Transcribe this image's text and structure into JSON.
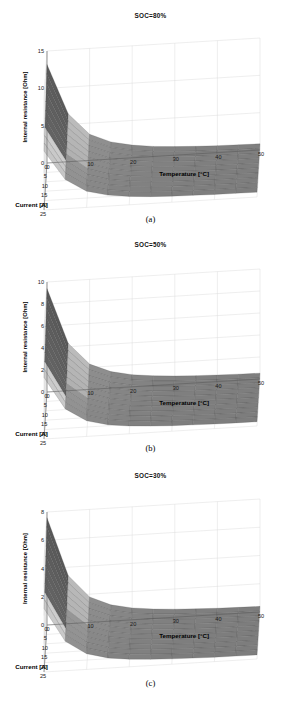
{
  "figure": {
    "background": "#ffffff",
    "grid_color": "#d9d9d9",
    "panels": [
      "a",
      "b",
      "c"
    ]
  },
  "panel_a": {
    "title": "SOC=80%",
    "caption": "(a)",
    "xlabel": "Current [A]",
    "ylabel": "Temperature [°C]",
    "zlabel": "Internal resistance [Ohm]",
    "xticks": [
      "0",
      "5",
      "10",
      "15",
      "20",
      "25"
    ],
    "yticks": [
      "0",
      "10",
      "20",
      "30",
      "40",
      "50"
    ],
    "zticks": [
      "0",
      "5",
      "10",
      "15"
    ]
  },
  "panel_b": {
    "title": "SOC=50%",
    "caption": "(b)",
    "xlabel": "Current [A]",
    "ylabel": "Temperature [°C]",
    "zlabel": "Internal resistance [Ohm]",
    "xticks": [
      "0",
      "5",
      "10",
      "15",
      "20",
      "25"
    ],
    "yticks": [
      "0",
      "10",
      "20",
      "30",
      "40",
      "50"
    ],
    "zticks": [
      "0",
      "2",
      "4",
      "6",
      "8",
      "10"
    ]
  },
  "panel_c": {
    "title": "SOC=30%",
    "caption": "(c)",
    "xlabel": "Current [A]",
    "ylabel": "Temperature [°C]",
    "zlabel": "Internal resistance [Ohm]",
    "xticks": [
      "0",
      "5",
      "10",
      "15",
      "20",
      "25"
    ],
    "yticks": [
      "0",
      "10",
      "20",
      "30",
      "40",
      "50"
    ],
    "zticks": [
      "0",
      "2",
      "4",
      "6",
      "8"
    ]
  },
  "chart_data": [
    {
      "type": "surface",
      "title": "SOC=80%",
      "caption": "(a)",
      "xlabel": "Current [A]",
      "ylabel": "Temperature [°C]",
      "zlabel": "Internal resistance [Ohm]",
      "xlim": [
        0,
        25
      ],
      "ylim": [
        0,
        50
      ],
      "zlim": [
        0,
        15
      ],
      "xticks": [
        0,
        5,
        10,
        15,
        20,
        25
      ],
      "yticks": [
        0,
        10,
        20,
        30,
        40,
        50
      ],
      "zticks": [
        0,
        5,
        10,
        15
      ],
      "grid": true,
      "colormap": "gray",
      "x": [
        0,
        2.5,
        5,
        7.5,
        10,
        12.5,
        15,
        17.5,
        20,
        22.5,
        25
      ],
      "y": [
        0,
        5,
        10,
        15,
        20,
        25,
        30,
        35,
        40,
        45,
        50
      ],
      "z": [
        [
          13.2,
          6.4,
          3.5,
          2.3,
          1.7,
          1.35,
          1.15,
          1.02,
          0.93,
          0.87,
          0.83
        ],
        [
          12.6,
          6.1,
          3.35,
          2.2,
          1.63,
          1.3,
          1.11,
          0.99,
          0.9,
          0.85,
          0.81
        ],
        [
          12.0,
          5.8,
          3.2,
          2.1,
          1.56,
          1.25,
          1.07,
          0.96,
          0.88,
          0.83,
          0.79
        ],
        [
          11.4,
          5.5,
          3.05,
          2.0,
          1.49,
          1.2,
          1.03,
          0.92,
          0.85,
          0.8,
          0.77
        ],
        [
          10.8,
          5.25,
          2.9,
          1.92,
          1.43,
          1.15,
          0.99,
          0.89,
          0.82,
          0.78,
          0.75
        ],
        [
          10.2,
          5.0,
          2.76,
          1.84,
          1.37,
          1.11,
          0.95,
          0.86,
          0.8,
          0.76,
          0.73
        ],
        [
          9.7,
          4.75,
          2.63,
          1.76,
          1.32,
          1.07,
          0.92,
          0.83,
          0.77,
          0.74,
          0.71
        ],
        [
          9.2,
          4.5,
          2.5,
          1.68,
          1.26,
          1.03,
          0.89,
          0.81,
          0.75,
          0.72,
          0.69
        ],
        [
          8.7,
          4.3,
          2.38,
          1.6,
          1.21,
          0.99,
          0.86,
          0.78,
          0.73,
          0.7,
          0.68
        ],
        [
          8.3,
          4.1,
          2.27,
          1.53,
          1.16,
          0.95,
          0.83,
          0.76,
          0.71,
          0.68,
          0.66
        ],
        [
          7.9,
          3.9,
          2.17,
          1.47,
          1.12,
          0.92,
          0.81,
          0.74,
          0.69,
          0.67,
          0.65
        ]
      ]
    },
    {
      "type": "surface",
      "title": "SOC=50%",
      "caption": "(b)",
      "xlabel": "Current [A]",
      "ylabel": "Temperature [°C]",
      "zlabel": "Internal resistance [Ohm]",
      "xlim": [
        0,
        25
      ],
      "ylim": [
        0,
        50
      ],
      "zlim": [
        0,
        10
      ],
      "xticks": [
        0,
        5,
        10,
        15,
        20,
        25
      ],
      "yticks": [
        0,
        10,
        20,
        30,
        40,
        50
      ],
      "zticks": [
        0,
        2,
        4,
        6,
        8,
        10
      ],
      "grid": true,
      "colormap": "gray",
      "x": [
        0,
        2.5,
        5,
        7.5,
        10,
        12.5,
        15,
        17.5,
        20,
        22.5,
        25
      ],
      "y": [
        0,
        5,
        10,
        15,
        20,
        25,
        30,
        35,
        40,
        45,
        50
      ],
      "z": [
        [
          9.4,
          4.3,
          2.3,
          1.5,
          1.1,
          0.88,
          0.75,
          0.66,
          0.6,
          0.56,
          0.53
        ],
        [
          9.0,
          4.1,
          2.2,
          1.43,
          1.05,
          0.84,
          0.72,
          0.64,
          0.58,
          0.54,
          0.52
        ],
        [
          8.5,
          3.9,
          2.1,
          1.37,
          1.0,
          0.8,
          0.69,
          0.61,
          0.56,
          0.52,
          0.5
        ],
        [
          8.1,
          3.7,
          2.0,
          1.3,
          0.96,
          0.77,
          0.66,
          0.59,
          0.54,
          0.51,
          0.48
        ],
        [
          7.7,
          3.55,
          1.9,
          1.24,
          0.92,
          0.74,
          0.63,
          0.57,
          0.52,
          0.49,
          0.47
        ],
        [
          7.3,
          3.37,
          1.81,
          1.19,
          0.88,
          0.71,
          0.61,
          0.55,
          0.5,
          0.47,
          0.45
        ],
        [
          6.9,
          3.2,
          1.72,
          1.13,
          0.84,
          0.68,
          0.59,
          0.53,
          0.48,
          0.46,
          0.44
        ],
        [
          6.6,
          3.04,
          1.64,
          1.08,
          0.8,
          0.65,
          0.56,
          0.51,
          0.47,
          0.44,
          0.42
        ],
        [
          6.2,
          2.89,
          1.56,
          1.03,
          0.77,
          0.63,
          0.54,
          0.49,
          0.45,
          0.43,
          0.41
        ],
        [
          5.9,
          2.75,
          1.49,
          0.99,
          0.74,
          0.6,
          0.52,
          0.47,
          0.44,
          0.42,
          0.4
        ],
        [
          5.6,
          2.62,
          1.42,
          0.94,
          0.71,
          0.58,
          0.5,
          0.46,
          0.42,
          0.4,
          0.39
        ]
      ]
    },
    {
      "type": "surface",
      "title": "SOC=30%",
      "caption": "(c)",
      "xlabel": "Current [A]",
      "ylabel": "Temperature [°C]",
      "zlabel": "Internal resistance [Ohm]",
      "xlim": [
        0,
        25
      ],
      "ylim": [
        0,
        50
      ],
      "zlim": [
        0,
        8
      ],
      "xticks": [
        0,
        5,
        10,
        15,
        20,
        25
      ],
      "yticks": [
        0,
        10,
        20,
        30,
        40,
        50
      ],
      "zticks": [
        0,
        2,
        4,
        6,
        8
      ],
      "grid": true,
      "colormap": "gray",
      "x": [
        0,
        2.5,
        5,
        7.5,
        10,
        12.5,
        15,
        17.5,
        20,
        22.5,
        25
      ],
      "y": [
        0,
        5,
        10,
        15,
        20,
        25,
        30,
        35,
        40,
        45,
        50
      ],
      "z": [
        [
          7.6,
          3.4,
          1.8,
          1.15,
          0.84,
          0.67,
          0.57,
          0.5,
          0.45,
          0.42,
          0.4
        ],
        [
          7.3,
          3.25,
          1.72,
          1.1,
          0.8,
          0.64,
          0.55,
          0.48,
          0.44,
          0.41,
          0.39
        ],
        [
          6.9,
          3.1,
          1.64,
          1.05,
          0.77,
          0.62,
          0.53,
          0.47,
          0.42,
          0.4,
          0.38
        ],
        [
          6.6,
          2.95,
          1.56,
          1.0,
          0.73,
          0.59,
          0.5,
          0.45,
          0.41,
          0.38,
          0.36
        ],
        [
          6.2,
          2.8,
          1.49,
          0.96,
          0.7,
          0.56,
          0.48,
          0.43,
          0.39,
          0.37,
          0.35
        ],
        [
          5.9,
          2.67,
          1.42,
          0.91,
          0.67,
          0.54,
          0.46,
          0.41,
          0.38,
          0.36,
          0.34
        ],
        [
          5.6,
          2.54,
          1.35,
          0.87,
          0.64,
          0.52,
          0.44,
          0.4,
          0.36,
          0.34,
          0.33
        ],
        [
          5.3,
          2.41,
          1.29,
          0.83,
          0.61,
          0.49,
          0.43,
          0.38,
          0.35,
          0.33,
          0.32
        ],
        [
          5.0,
          2.3,
          1.23,
          0.79,
          0.59,
          0.47,
          0.41,
          0.37,
          0.34,
          0.32,
          0.31
        ],
        [
          4.8,
          2.19,
          1.17,
          0.76,
          0.56,
          0.46,
          0.39,
          0.35,
          0.33,
          0.31,
          0.3
        ],
        [
          4.5,
          2.08,
          1.11,
          0.72,
          0.54,
          0.44,
          0.38,
          0.34,
          0.31,
          0.3,
          0.29
        ]
      ]
    }
  ]
}
